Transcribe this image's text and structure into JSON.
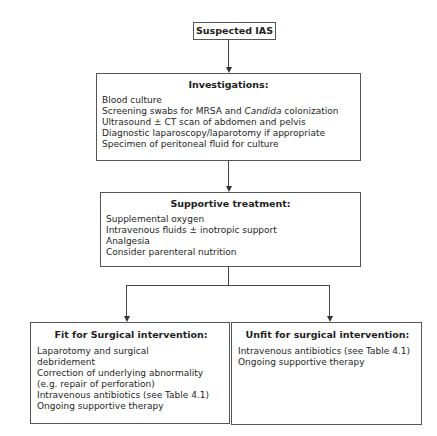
{
  "flowchart": {
    "start": {
      "label": "Suspected IAS"
    },
    "investigations": {
      "title": "Investigations:",
      "items": [
        "Blood culture",
        "Screening swabs for MRSA and ",
        "Ultrasound ± CT scan of abdomen and pelvis",
        "Diagnostic laparoscopy/laparotomy if appropriate",
        "Specimen of peritoneal fluid for culture"
      ],
      "item1_italic": "Candida",
      "item1_tail": " colonization"
    },
    "supportive": {
      "title": "Supportive treatment:",
      "items": [
        "Supplemental oxygen",
        "Intravenous fluids ± inotropic support",
        "Analgesia",
        "Consider parenteral nutrition"
      ]
    },
    "fit": {
      "title": "Fit for Surgical intervention:",
      "items": [
        "Laparotomy and surgical debridement",
        "Correction of underlying abnormality (e.g. repair of perforation)",
        "Intravenous antibiotics (see Table 4.1)",
        "Ongoing supportive therapy"
      ]
    },
    "unfit": {
      "title": "Unfit for surgical intervention:",
      "items": [
        "Intravenous antibiotics (see Table 4.1)",
        "Ongoing supportive therapy"
      ]
    }
  }
}
